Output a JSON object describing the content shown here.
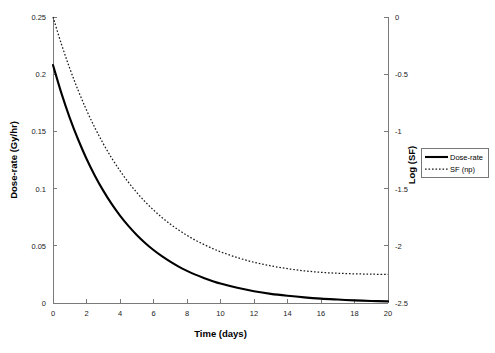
{
  "chart_data": {
    "type": "line",
    "title": "",
    "subtitle": "",
    "xlabel": "Time (days)",
    "ylabel": "Dose-rate (Gy/hr)",
    "y2label": "Log (SF)",
    "grid": false,
    "legend_position": "right",
    "xlim": [
      0,
      20
    ],
    "ylim": [
      0,
      0.25
    ],
    "y2lim": [
      -2.5,
      0
    ],
    "xticks": [
      0,
      2,
      4,
      6,
      8,
      10,
      12,
      14,
      16,
      18,
      20
    ],
    "xticklabels": [
      "0",
      "2",
      "4",
      "6",
      "8",
      "10",
      "12",
      "14",
      "16",
      "18",
      "20"
    ],
    "yticks": [
      0,
      0.05,
      0.1,
      0.15,
      0.2,
      0.25
    ],
    "yticklabels": [
      "0",
      "0.05",
      "0.1",
      "0.15",
      "0.2",
      "0.25"
    ],
    "y2ticks": [
      -2.5,
      -2,
      -1.5,
      -1,
      -0.5,
      0
    ],
    "y2ticklabels": [
      "-2.5",
      "-2",
      "-1.5",
      "-1",
      "-0.5",
      "0"
    ],
    "x": [
      0,
      0.5,
      1,
      1.5,
      2,
      2.5,
      3,
      3.5,
      4,
      4.5,
      5,
      5.5,
      6,
      6.5,
      7,
      7.5,
      8,
      8.5,
      9,
      9.5,
      10,
      11,
      12,
      13,
      14,
      15,
      16,
      17,
      18,
      19,
      20
    ],
    "series": [
      {
        "name": "Dose-rate",
        "axis": "left",
        "style": "solid",
        "color": "#000000",
        "units": "Gy/hr",
        "values": [
          0.208,
          0.1835,
          0.1619,
          0.1429,
          0.1261,
          0.1113,
          0.0982,
          0.0866,
          0.0764,
          0.0674,
          0.0595,
          0.0525,
          0.0463,
          0.0409,
          0.0361,
          0.0318,
          0.0281,
          0.0248,
          0.0219,
          0.0193,
          0.017,
          0.0133,
          0.0103,
          0.008,
          0.0063,
          0.0049,
          0.0038,
          0.003,
          0.0023,
          0.0018,
          0.0014
        ]
      },
      {
        "name": "SF (np)",
        "axis": "right",
        "style": "dotted",
        "color": "#1a1a1a",
        "units": "log10 surviving fraction",
        "values": [
          0.0,
          -0.236,
          -0.449,
          -0.641,
          -0.813,
          -0.968,
          -1.107,
          -1.232,
          -1.344,
          -1.444,
          -1.534,
          -1.615,
          -1.687,
          -1.752,
          -1.81,
          -1.862,
          -1.909,
          -1.951,
          -1.988,
          -2.022,
          -2.052,
          -2.103,
          -2.144,
          -2.175,
          -2.2,
          -2.219,
          -2.232,
          -2.24,
          -2.245,
          -2.248,
          -2.25
        ]
      }
    ],
    "annotations": []
  },
  "legend": {
    "entries": [
      {
        "label": "Dose-rate",
        "style": "solid"
      },
      {
        "label": "SF (np)",
        "style": "dotted"
      }
    ]
  },
  "colors": {
    "background": "#ffffff",
    "axis": "#7a7a7a",
    "text": "#000000",
    "series_solid": "#000000",
    "series_dotted": "#1a1a1a"
  }
}
